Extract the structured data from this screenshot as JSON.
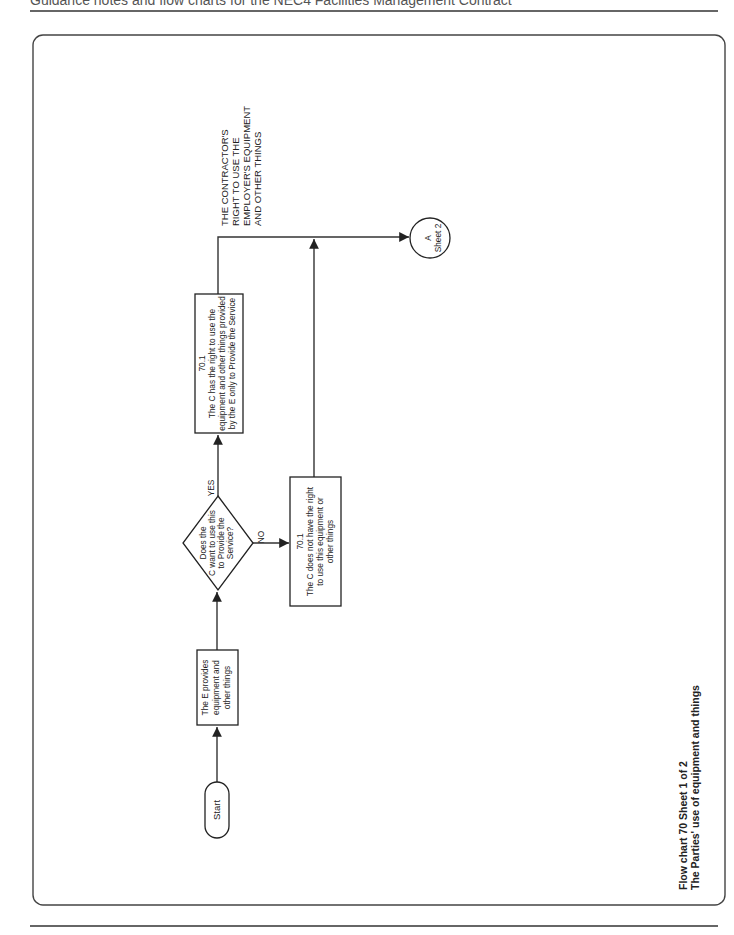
{
  "header": {
    "running_title": "Guidance notes and flow charts for the NEC4 Facilities Management Contract"
  },
  "diagram": {
    "title_line1": "Flow chart 70 Sheet 1 of 2",
    "title_line2": "The Parties' use of equipment and things",
    "start": {
      "label": "Start"
    },
    "employer_provides": {
      "lines": [
        "The E provides",
        "equipment and",
        "other things"
      ]
    },
    "decision": {
      "lines": [
        "Does the",
        "C want to use this",
        "to Provide the",
        "Service?"
      ],
      "yes_label": "YES",
      "no_label": "NO"
    },
    "has_right": {
      "clause": "70.1",
      "lines": [
        "The C has the right to use the",
        "equipment and other things provided",
        "by the E only to Provide the Service"
      ]
    },
    "no_right": {
      "clause": "70.1",
      "lines": [
        "The C does not have the right",
        "to use this equipment or",
        "other things"
      ]
    },
    "section_heading": {
      "lines": [
        "THE CONTRACTOR'S",
        "RIGHT TO USE THE",
        "EMPLOYER'S EQUIPMENT",
        "AND OTHER THINGS"
      ]
    },
    "connector": {
      "letter": "A",
      "target": "Sheet 2"
    }
  }
}
